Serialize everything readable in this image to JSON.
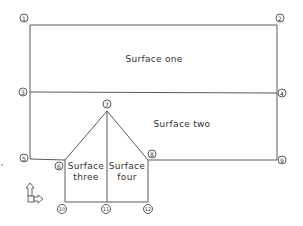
{
  "diagram": {
    "type": "roof-surface-plan",
    "nodes": [
      {
        "id": 1,
        "label": "1",
        "x": 24,
        "y": 18
      },
      {
        "id": 2,
        "label": "2",
        "x": 280,
        "y": 18
      },
      {
        "id": 3,
        "label": "3",
        "x": 23,
        "y": 92
      },
      {
        "id": 4,
        "label": "4",
        "x": 282,
        "y": 93
      },
      {
        "id": 5,
        "label": "5",
        "x": 24,
        "y": 158
      },
      {
        "id": 6,
        "label": "6",
        "x": 59,
        "y": 166
      },
      {
        "id": 7,
        "label": "7",
        "x": 107,
        "y": 104
      },
      {
        "id": 8,
        "label": "8",
        "x": 152,
        "y": 154
      },
      {
        "id": 9,
        "label": "9",
        "x": 282,
        "y": 160
      },
      {
        "id": 10,
        "label": "10",
        "x": 62,
        "y": 209
      },
      {
        "id": 11,
        "label": "11",
        "x": 106,
        "y": 209
      },
      {
        "id": 12,
        "label": "12",
        "x": 148,
        "y": 209
      }
    ],
    "surfaces": [
      {
        "id": "one",
        "label_line1": "Surface one",
        "label_line2": ""
      },
      {
        "id": "two",
        "label_line1": "Surface two",
        "label_line2": ""
      },
      {
        "id": "three",
        "label_line1": "Surface",
        "label_line2": "three"
      },
      {
        "id": "four",
        "label_line1": "Surface",
        "label_line2": "four"
      }
    ],
    "axis_icon": "ucs-axis-icon"
  }
}
